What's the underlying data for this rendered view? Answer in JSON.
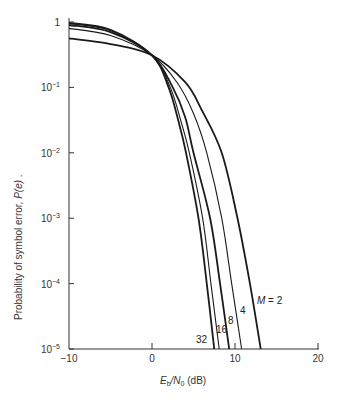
{
  "chart_data": {
    "type": "line",
    "title": "",
    "xlabel": "E_b/N_0 (dB)",
    "ylabel": "Probability of symbol error, P(e).",
    "xlim": [
      -10,
      20
    ],
    "ylim": [
      1e-05,
      1
    ],
    "yscale": "log",
    "grid": false,
    "x_ticks": [
      "-10",
      "0",
      "10",
      "20"
    ],
    "y_ticks": [
      "1",
      "10^-1",
      "10^-2",
      "10^-3",
      "10^-4",
      "10^-5"
    ],
    "series": [
      {
        "name": "M = 2",
        "label": "M = 2",
        "x": [
          -10,
          -5,
          0,
          4,
          6,
          8.4,
          10.3,
          11.8,
          13.1
        ],
        "y": [
          0.56,
          0.46,
          0.31,
          0.12,
          0.045,
          0.01,
          0.001,
          0.0001,
          1e-05
        ]
      },
      {
        "name": "M = 4",
        "label": "4",
        "x": [
          -10,
          -5,
          0,
          3,
          5,
          6.6,
          8.4,
          9.6,
          10.8
        ],
        "y": [
          0.8,
          0.62,
          0.31,
          0.12,
          0.04,
          0.01,
          0.001,
          0.0001,
          1e-05
        ]
      },
      {
        "name": "M = 8",
        "label": "8",
        "x": [
          -10,
          -5,
          0,
          2.5,
          4,
          5.0,
          7.0,
          8.2,
          9.3
        ],
        "y": [
          0.9,
          0.7,
          0.31,
          0.1,
          0.035,
          0.01,
          0.001,
          0.0001,
          1e-05
        ]
      },
      {
        "name": "M = 16",
        "label": "16",
        "x": [
          -10,
          -5,
          0,
          2.2,
          3.5,
          4.5,
          6.1,
          7.1,
          8.1
        ],
        "y": [
          0.95,
          0.74,
          0.31,
          0.1,
          0.03,
          0.01,
          0.001,
          0.0001,
          1e-05
        ]
      },
      {
        "name": "M = 32",
        "label": "32",
        "x": [
          -10,
          -5,
          0,
          2.0,
          3.2,
          4.1,
          5.6,
          6.6,
          7.5
        ],
        "y": [
          0.97,
          0.76,
          0.31,
          0.1,
          0.03,
          0.01,
          0.001,
          0.0001,
          1e-05
        ]
      }
    ],
    "annotations": [
      "M = 2",
      "4",
      "8",
      "16",
      "32"
    ]
  },
  "plot": {
    "px": {
      "x0": 69,
      "x_per_db": 8.3,
      "xmin": -10,
      "y_top": 22,
      "y_per_decade": 65.4,
      "y_bottom": 349
    },
    "stroke_color": "#1a1a1a",
    "axis_color": "#333333"
  },
  "labels": {
    "x_axis_E": "E",
    "x_axis_b": "b",
    "x_axis_N": "/N",
    "x_axis_0": "0",
    "x_axis_unit": " (dB)",
    "y_axis": "Probability of symbol error, ",
    "y_axis_pe": "P(e)",
    "y_axis_end": " .",
    "m_label_prefix": "M",
    "m_label_suffix": " = 2",
    "label_4": "4",
    "label_8": "8",
    "label_16": "16",
    "label_32": "32"
  }
}
